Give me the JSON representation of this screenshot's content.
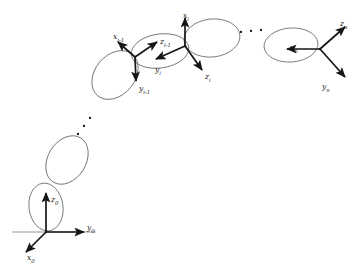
{
  "figure": {
    "name": "robot-kinematic-chain-diagram",
    "width": 361,
    "height": 267,
    "background_color": "#ffffff",
    "link_outline_color": "#6b6b6b",
    "arrow_color": "#161616",
    "ground_line_color": "#8a8a8a",
    "label_color": "#1a1a1a"
  },
  "frames": [
    {
      "id": "base",
      "name": "base-frame",
      "origin": [
        46,
        232
      ],
      "axes": [
        {
          "id": "z0",
          "axis": "z",
          "base": "z",
          "sub": "0",
          "label_x": 51,
          "label_y": 196,
          "tip": [
            46,
            193
          ]
        },
        {
          "id": "y0",
          "axis": "y",
          "base": "y",
          "sub": "0",
          "label_x": 87,
          "label_y": 224,
          "tip": [
            84,
            232
          ]
        },
        {
          "id": "x0",
          "axis": "x",
          "base": "x",
          "sub": "0",
          "label_x": 27,
          "label_y": 254,
          "tip": [
            26,
            252
          ]
        }
      ]
    },
    {
      "id": "i_minus_1",
      "name": "frame-i-minus-1",
      "origin": [
        135,
        57
      ],
      "axes": [
        {
          "id": "xim1",
          "axis": "x",
          "base": "x",
          "sub": "i-1",
          "label_x": 113,
          "label_y": 33,
          "tip": [
            118,
            42
          ]
        },
        {
          "id": "zim1",
          "axis": "z",
          "base": "z",
          "sub": "i-1",
          "label_x": 160,
          "label_y": 38,
          "tip": [
            157,
            42
          ]
        },
        {
          "id": "yim1",
          "axis": "y",
          "base": "y",
          "sub": "i-1",
          "label_x": 139,
          "label_y": 85,
          "tip": [
            136,
            81
          ]
        }
      ]
    },
    {
      "id": "i",
      "name": "frame-i",
      "origin": [
        185,
        46
      ],
      "axes": [
        {
          "id": "xi",
          "axis": "x",
          "base": "x",
          "sub": "i",
          "label_x": 183,
          "label_y": 12,
          "tip": [
            185,
            18
          ]
        },
        {
          "id": "yi",
          "axis": "y",
          "base": "y",
          "sub": "i",
          "label_x": 155,
          "label_y": 66,
          "tip": [
            156,
            59
          ]
        },
        {
          "id": "zi",
          "axis": "z",
          "base": "z",
          "sub": "i",
          "label_x": 205,
          "label_y": 73,
          "tip": [
            202,
            70
          ]
        }
      ]
    },
    {
      "id": "n",
      "name": "end-effector-frame-n",
      "origin": [
        320,
        49
      ],
      "axes": [
        {
          "id": "xn",
          "axis": "x",
          "base": "x",
          "sub": "n",
          "label_x": 290,
          "label_y": 44,
          "tip": [
            287,
            49
          ]
        },
        {
          "id": "zn",
          "axis": "z",
          "base": "z",
          "sub": "n",
          "label_x": 340,
          "label_y": 20,
          "tip": [
            345,
            27
          ]
        },
        {
          "id": "yn",
          "axis": "y",
          "base": "y",
          "sub": "n",
          "label_x": 322,
          "label_y": 83,
          "tip": [
            345,
            77
          ]
        }
      ]
    }
  ],
  "links": [
    {
      "id": "link-base",
      "name": "link-ellipse-base",
      "cx": 46,
      "cy": 207,
      "rx": 17,
      "ry": 24,
      "rotate": -8
    },
    {
      "id": "link-1",
      "name": "link-ellipse-lower",
      "cx": 67,
      "cy": 160,
      "rx": 19,
      "ry": 26,
      "rotate": 32
    },
    {
      "id": "link-im1",
      "name": "link-ellipse-i-minus-1",
      "cx": 115,
      "cy": 75,
      "rx": 20,
      "ry": 27,
      "rotate": 40
    },
    {
      "id": "link-i",
      "name": "link-ellipse-i",
      "cx": 160,
      "cy": 51,
      "rx": 29,
      "ry": 17,
      "rotate": -8
    },
    {
      "id": "link-i2",
      "name": "link-ellipse-i-next",
      "cx": 212,
      "cy": 38,
      "rx": 28,
      "ry": 19,
      "rotate": -6
    },
    {
      "id": "link-n",
      "name": "link-ellipse-n",
      "cx": 291,
      "cy": 45,
      "rx": 27,
      "ry": 17,
      "rotate": -4
    }
  ],
  "ellipsis": [
    {
      "id": "dots-lower",
      "name": "ellipsis-dots-lower-chain",
      "orientation": "diagonal",
      "dots": [
        [
          78,
          134
        ],
        [
          84,
          126
        ],
        [
          90,
          118
        ]
      ]
    },
    {
      "id": "dots-upper",
      "name": "ellipsis-dots-upper-chain",
      "orientation": "horizontal",
      "dots": [
        [
          241,
          32
        ],
        [
          251,
          31
        ],
        [
          261,
          30
        ]
      ]
    }
  ],
  "ground": {
    "name": "ground-line",
    "x1": 12,
    "x2": 96,
    "y": 232
  }
}
